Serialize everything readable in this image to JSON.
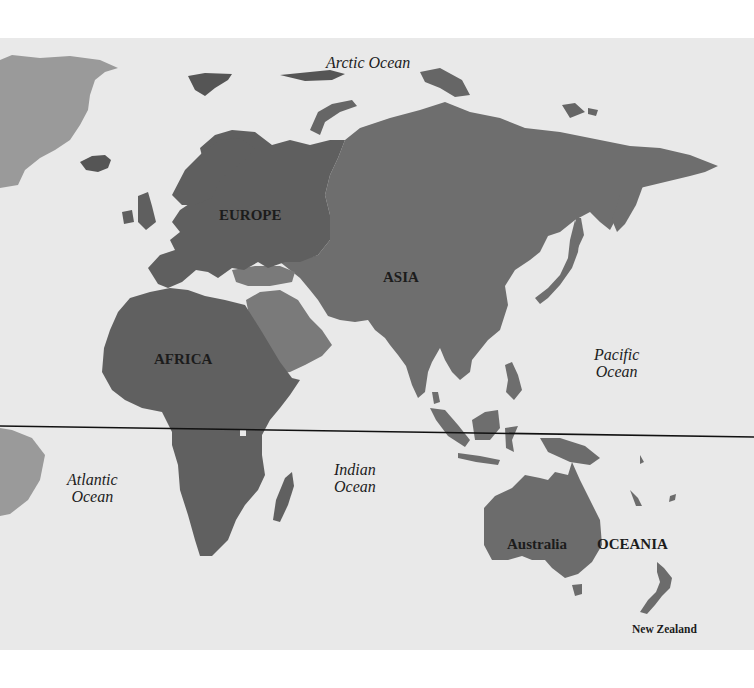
{
  "map": {
    "type": "world-map-eastern-hemisphere",
    "colors": {
      "background": "#ffffff",
      "sea": "#e9e9e9",
      "europe": "#5f5f5f",
      "asia": "#6e6e6e",
      "middle_east": "#7a7a7a",
      "africa": "#606060",
      "oceania": "#6c6c6c",
      "americas": "#9a9a9a",
      "equator": "#111111"
    },
    "continents": {
      "europe": "EUROPE",
      "asia": "ASIA",
      "africa": "AFRICA",
      "oceania": "OCEANIA",
      "australia": "Australia",
      "new_zealand": "New Zealand"
    },
    "oceans": {
      "arctic": "Arctic Ocean",
      "pacific_line1": "Pacific",
      "pacific_line2": "Ocean",
      "atlantic_line1": "Atlantic",
      "atlantic_line2": "Ocean",
      "indian_line1": "Indian",
      "indian_line2": "Ocean"
    },
    "equator": {
      "label": "",
      "y": 433
    }
  }
}
